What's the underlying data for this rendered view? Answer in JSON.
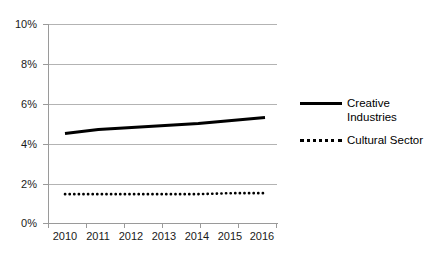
{
  "chart_data": {
    "type": "line",
    "title": "",
    "xlabel": "",
    "ylabel": "",
    "x": [
      "2010",
      "2011",
      "2012",
      "2013",
      "2014",
      "2015",
      "2016"
    ],
    "categories": [
      "2010",
      "2011",
      "2012",
      "2013",
      "2014",
      "2015",
      "2016"
    ],
    "series": [
      {
        "name": "Creative Industries",
        "style": "solid",
        "color": "#000000",
        "values": [
          4.5,
          4.7,
          4.8,
          4.9,
          5.0,
          5.15,
          5.3
        ]
      },
      {
        "name": "Cultural Sector",
        "style": "dotted",
        "color": "#000000",
        "values": [
          1.45,
          1.45,
          1.45,
          1.45,
          1.45,
          1.5,
          1.5
        ]
      }
    ],
    "ylim": [
      0,
      10
    ],
    "ytick_values": [
      0,
      2,
      4,
      6,
      8,
      10
    ],
    "ytick_labels": [
      "0%",
      "2%",
      "4%",
      "6%",
      "8%",
      "10%"
    ],
    "grid": true,
    "grid_color": "#b3b3b3",
    "axis_color": "#9a9a9a",
    "legend_position": "right",
    "legend": [
      {
        "label_line1": "Creative",
        "label_line2": "Industries",
        "style": "solid"
      },
      {
        "label_line1": "Cultural Sector",
        "label_line2": "",
        "style": "dotted"
      }
    ]
  },
  "axes": {
    "y_labels": [
      "10%",
      "8%",
      "6%",
      "4%",
      "2%",
      "0%"
    ],
    "x_labels": [
      "2010",
      "2011",
      "2012",
      "2013",
      "2014",
      "2015",
      "2016"
    ]
  },
  "legend": {
    "creative_line1": "Creative",
    "creative_line2": "Industries",
    "cultural_line1": "Cultural Sector"
  }
}
